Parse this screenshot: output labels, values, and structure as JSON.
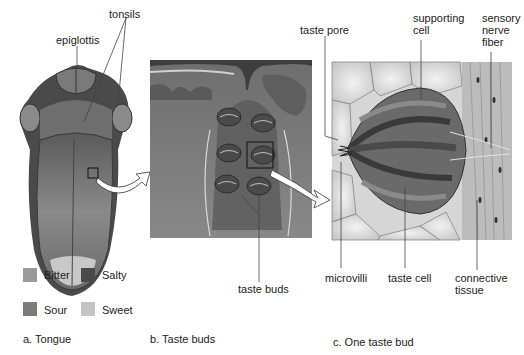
{
  "panels": {
    "a": {
      "caption": "a. Tongue",
      "labels": {
        "epiglottis": "epiglottis",
        "tonsils": "tonsils"
      },
      "legend": [
        {
          "name": "Bitter",
          "color": "#9a9a9a"
        },
        {
          "name": "Salty",
          "color": "#4a4a4a"
        },
        {
          "name": "Sour",
          "color": "#7a7a7a"
        },
        {
          "name": "Sweet",
          "color": "#c4c4c4"
        }
      ]
    },
    "b": {
      "caption": "b. Taste buds",
      "labels": {
        "taste_buds": "taste buds"
      }
    },
    "c": {
      "caption": "c. One taste bud",
      "labels": {
        "taste_pore": "taste pore",
        "supporting_cell": "supporting\ncell",
        "sensory_nerve_fiber": "sensory\nnerve\nfiber",
        "microvilli": "microvilli",
        "taste_cell": "taste cell",
        "connective_tissue": "connective\ntissue"
      }
    }
  }
}
